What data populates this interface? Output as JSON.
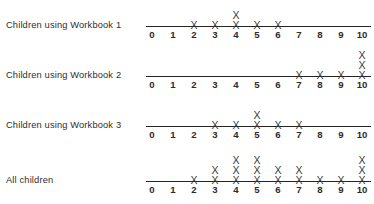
{
  "chart_data": {
    "type": "scatter",
    "plot_style": "dot-plot",
    "title": "",
    "xlabel": "",
    "ylabel": "",
    "xlim": [
      0,
      10
    ],
    "grid": false,
    "legend": null,
    "mark_glyph": "X",
    "tick_labels": [
      "0",
      "1",
      "2",
      "3",
      "4",
      "5",
      "6",
      "7",
      "8",
      "9",
      "10"
    ],
    "x": [
      0,
      1,
      2,
      3,
      4,
      5,
      6,
      7,
      8,
      9,
      10
    ],
    "series": [
      {
        "name": "Children using Workbook 1",
        "values": [
          0,
          0,
          1,
          1,
          2,
          1,
          1,
          0,
          0,
          0,
          0
        ],
        "total": 6
      },
      {
        "name": "Children using Workbook 2",
        "values": [
          0,
          0,
          0,
          0,
          0,
          0,
          0,
          1,
          1,
          1,
          3
        ],
        "total": 6
      },
      {
        "name": "Children using Workbook 3",
        "values": [
          0,
          0,
          0,
          1,
          1,
          2,
          1,
          1,
          0,
          0,
          0
        ],
        "total": 6
      },
      {
        "name": "All children",
        "values": [
          0,
          0,
          1,
          2,
          3,
          3,
          2,
          2,
          1,
          1,
          3
        ],
        "total": 18
      }
    ]
  },
  "colors": {
    "background": "#ffffff",
    "axis": "#242424",
    "mark": "#3a3a3a",
    "text": "#2b2b2b"
  }
}
